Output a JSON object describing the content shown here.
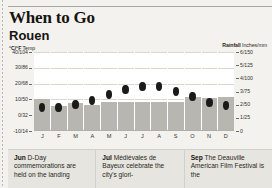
{
  "header": {
    "title": "When to Go",
    "city": "Rouen"
  },
  "axes": {
    "left_caption_bold": "°C/°F",
    "left_caption_rest": " Temp",
    "right_caption_bold": "Rainfall",
    "right_caption_rest": " Inches/mm"
  },
  "notes": [
    {
      "label": "Jun",
      "text": " D-Day commemorations are held on the landing"
    },
    {
      "label": "Jul",
      "text": " Médiévales de Bayeux celebrate the city's glori-"
    },
    {
      "label": "Sep",
      "text": " The Deauville American Film Festival is the"
    }
  ],
  "chart_data": {
    "type": "bar",
    "subtitle": "Monthly average temperature and rainfall",
    "categories": [
      "J",
      "F",
      "M",
      "A",
      "M",
      "J",
      "J",
      "A",
      "S",
      "O",
      "N",
      "D"
    ],
    "month_names": [
      "January",
      "February",
      "March",
      "April",
      "May",
      "June",
      "July",
      "August",
      "September",
      "October",
      "November",
      "December"
    ],
    "grid": true,
    "legend": "none",
    "series": [
      {
        "name": "Rainfall",
        "type": "bar",
        "unit": "inches",
        "unit_secondary": "mm",
        "axis": "right",
        "color": "#b8b6b1",
        "values": [
          2.4,
          1.9,
          2.1,
          2.0,
          2.2,
          2.2,
          2.2,
          2.2,
          2.2,
          2.6,
          2.5,
          2.6
        ],
        "values_mm": [
          61,
          48,
          53,
          51,
          56,
          56,
          56,
          56,
          56,
          66,
          64,
          66
        ]
      },
      {
        "name": "Temperature",
        "type": "scatter",
        "unit": "°C",
        "unit_secondary": "°F",
        "axis": "left",
        "color": "#1a1a1a",
        "values": [
          5,
          5,
          7,
          9,
          13,
          16,
          18,
          18,
          15,
          12,
          8,
          6
        ],
        "values_f": [
          41,
          41,
          45,
          48,
          55,
          61,
          64,
          64,
          59,
          54,
          46,
          43
        ]
      }
    ],
    "left_axis": {
      "label": "°C/°F Temp",
      "ylim": [
        -10,
        40
      ],
      "ticks": [
        {
          "value": 40,
          "label": "40/104"
        },
        {
          "value": 30,
          "label": "30/86"
        },
        {
          "value": 20,
          "label": "20/68"
        },
        {
          "value": 10,
          "label": "10/50"
        },
        {
          "value": 0,
          "label": "0/32"
        },
        {
          "value": -10,
          "label": "-10/14"
        }
      ]
    },
    "right_axis": {
      "label": "Rainfall Inches/mm",
      "ylim": [
        0,
        6
      ],
      "ticks": [
        {
          "value": 6,
          "label": "6/150"
        },
        {
          "value": 5,
          "label": "5/125"
        },
        {
          "value": 4,
          "label": "4/100"
        },
        {
          "value": 3,
          "label": "3/75"
        },
        {
          "value": 2,
          "label": "2/50"
        },
        {
          "value": 1,
          "label": "1/25"
        },
        {
          "value": 0,
          "label": "0"
        }
      ]
    },
    "xlabel": "",
    "ylabel": "°C/°F Temp"
  }
}
